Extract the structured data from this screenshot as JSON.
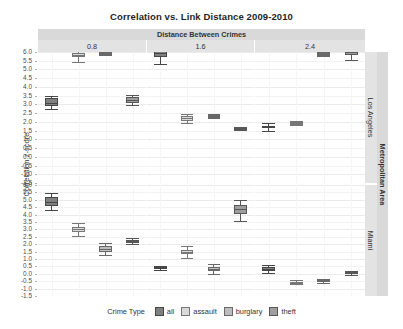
{
  "title": "Correlation vs. Link Distance 2009-2010",
  "strips": {
    "top_outer": "Distance Between Crimes",
    "top_inner": [
      "0.8",
      "1.6",
      "2.4"
    ],
    "right_outer": "Metropolitan Area",
    "right_inner": [
      "Los Angeles",
      "Miami"
    ]
  },
  "axes": {
    "ylabel": "Correlation z-score",
    "yticks": [
      "6.0",
      "5.5",
      "5.0",
      "4.5",
      "4.0",
      "3.5",
      "3.0",
      "2.5",
      "2.0",
      "1.5",
      "1.0",
      "0.5",
      "0.0",
      "-0.5",
      "-1.0",
      "-1.5"
    ],
    "ymin": -1.5,
    "ymax": 6.0
  },
  "legend": {
    "title": "Crime Type",
    "items": [
      {
        "label": "all",
        "color": "#808080"
      },
      {
        "label": "assault",
        "color": "#d9d9d9"
      },
      {
        "label": "burglary",
        "color": "#bdbdbd"
      },
      {
        "label": "theft",
        "color": "#9e9e9e"
      }
    ]
  },
  "chart_data": {
    "type": "box",
    "title": "Correlation vs. Link Distance 2009-2010",
    "xlabel": "",
    "ylabel": "Correlation z-score",
    "ylim": [
      -1.5,
      6.0
    ],
    "ytick_step": 0.5,
    "grid": true,
    "legend_position": "bottom",
    "facet_col_var": "Distance Between Crimes",
    "facet_col_levels": [
      "0.8",
      "1.6",
      "2.4"
    ],
    "facet_row_var": "Metropolitan Area",
    "facet_row_levels": [
      "Los Angeles",
      "Miami"
    ],
    "group_var": "Crime Type",
    "groups": [
      "all",
      "assault",
      "burglary",
      "theft"
    ],
    "colors": [
      "#808080",
      "#d9d9d9",
      "#bdbdbd",
      "#9e9e9e"
    ],
    "panels": [
      {
        "row": "Los Angeles",
        "col": "0.8",
        "boxes": [
          {
            "group": "all",
            "lower_whisker": 2.75,
            "q1": 2.9,
            "median": 3.1,
            "q3": 3.35,
            "upper_whisker": 3.5
          },
          {
            "group": "assault",
            "lower_whisker": 5.45,
            "q1": 5.7,
            "median": 5.85,
            "q3": 5.95,
            "upper_whisker": 6.1
          },
          {
            "group": "burglary",
            "lower_whisker": 5.8,
            "q1": 5.85,
            "median": 5.9,
            "q3": 5.95,
            "upper_whisker": 6.0
          },
          {
            "group": "theft",
            "lower_whisker": 2.95,
            "q1": 3.1,
            "median": 3.25,
            "q3": 3.4,
            "upper_whisker": 3.55
          }
        ]
      },
      {
        "row": "Los Angeles",
        "col": "1.6",
        "boxes": [
          {
            "group": "all",
            "lower_whisker": 5.3,
            "q1": 5.7,
            "median": 5.95,
            "q3": 6.2,
            "upper_whisker": 6.35
          },
          {
            "group": "assault",
            "lower_whisker": 1.95,
            "q1": 2.05,
            "median": 2.2,
            "q3": 2.35,
            "upper_whisker": 2.45
          },
          {
            "group": "burglary",
            "lower_whisker": 2.2,
            "q1": 2.25,
            "median": 2.3,
            "q3": 2.4,
            "upper_whisker": 2.45
          },
          {
            "group": "theft",
            "lower_whisker": 1.55,
            "q1": 1.58,
            "median": 1.62,
            "q3": 1.68,
            "upper_whisker": 1.72
          }
        ]
      },
      {
        "row": "Los Angeles",
        "col": "2.4",
        "boxes": [
          {
            "group": "all",
            "lower_whisker": 1.5,
            "q1": 1.65,
            "median": 1.72,
            "q3": 1.78,
            "upper_whisker": 1.95
          },
          {
            "group": "assault",
            "lower_whisker": 1.8,
            "q1": 1.85,
            "median": 1.9,
            "q3": 1.98,
            "upper_whisker": 2.05
          },
          {
            "group": "burglary",
            "lower_whisker": 5.75,
            "q1": 5.8,
            "median": 5.85,
            "q3": 5.92,
            "upper_whisker": 5.98
          },
          {
            "group": "theft",
            "lower_whisker": 5.55,
            "q1": 5.8,
            "median": 5.9,
            "q3": 6.0,
            "upper_whisker": 6.2
          }
        ]
      },
      {
        "row": "Miami",
        "col": "0.8",
        "boxes": [
          {
            "group": "all",
            "lower_whisker": 4.3,
            "q1": 4.55,
            "median": 4.85,
            "q3": 5.2,
            "upper_whisker": 5.45
          },
          {
            "group": "assault",
            "lower_whisker": 2.55,
            "q1": 2.85,
            "median": 3.0,
            "q3": 3.15,
            "upper_whisker": 3.45
          },
          {
            "group": "burglary",
            "lower_whisker": 1.3,
            "q1": 1.5,
            "median": 1.7,
            "q3": 1.9,
            "upper_whisker": 2.05
          },
          {
            "group": "theft",
            "lower_whisker": 2.0,
            "q1": 2.1,
            "median": 2.2,
            "q3": 2.3,
            "upper_whisker": 2.4
          }
        ]
      },
      {
        "row": "Miami",
        "col": "1.6",
        "boxes": [
          {
            "group": "all",
            "lower_whisker": 0.25,
            "q1": 0.32,
            "median": 0.4,
            "q3": 0.48,
            "upper_whisker": 0.55
          },
          {
            "group": "assault",
            "lower_whisker": 1.05,
            "q1": 1.35,
            "median": 1.5,
            "q3": 1.62,
            "upper_whisker": 1.9
          },
          {
            "group": "burglary",
            "lower_whisker": 0.0,
            "q1": 0.18,
            "median": 0.32,
            "q3": 0.48,
            "upper_whisker": 0.65
          },
          {
            "group": "theft",
            "lower_whisker": 3.55,
            "q1": 4.05,
            "median": 4.35,
            "q3": 4.65,
            "upper_whisker": 5.0
          }
        ]
      },
      {
        "row": "Miami",
        "col": "2.4",
        "boxes": [
          {
            "group": "all",
            "lower_whisker": 0.05,
            "q1": 0.2,
            "median": 0.32,
            "q3": 0.48,
            "upper_whisker": 0.6
          },
          {
            "group": "assault",
            "lower_whisker": -0.7,
            "q1": -0.65,
            "median": -0.6,
            "q3": -0.55,
            "upper_whisker": -0.45
          },
          {
            "group": "burglary",
            "lower_whisker": -0.65,
            "q1": -0.58,
            "median": -0.5,
            "q3": -0.42,
            "upper_whisker": -0.35
          },
          {
            "group": "theft",
            "lower_whisker": -0.1,
            "q1": -0.02,
            "median": 0.05,
            "q3": 0.15,
            "upper_whisker": 0.22
          }
        ]
      }
    ]
  }
}
